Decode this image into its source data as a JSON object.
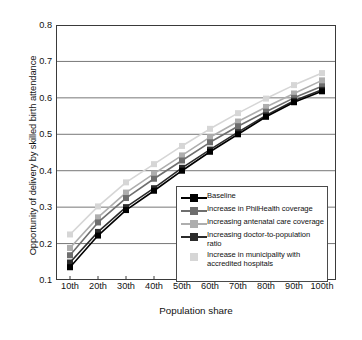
{
  "chart_data": {
    "type": "line",
    "title": "",
    "xlabel": "Population share",
    "ylabel": "Opportunity of delivery by skilled birth attendance",
    "categories": [
      "10th",
      "20th",
      "30th",
      "40th",
      "50th",
      "60th",
      "70th",
      "80th",
      "90th",
      "100th"
    ],
    "ylim": [
      0.1,
      0.8
    ],
    "yticks": [
      "0.1",
      "0.2",
      "0.3",
      "0.4",
      "0.5",
      "0.6",
      "0.7",
      "0.8"
    ],
    "grid": "horizontal",
    "legend_position": "inside-bottom-right",
    "series": [
      {
        "name": "Baseline",
        "color": "#000000",
        "marker": "square",
        "values": [
          0.135,
          0.222,
          0.292,
          0.345,
          0.4,
          0.452,
          0.5,
          0.548,
          0.588,
          0.618
        ]
      },
      {
        "name": "Increase in PhilHealth coverage",
        "color": "#6e6e6e",
        "marker": "square",
        "values": [
          0.168,
          0.258,
          0.325,
          0.378,
          0.428,
          0.478,
          0.522,
          0.562,
          0.6,
          0.632
        ]
      },
      {
        "name": "Increasing antenatal care coverage",
        "color": "#aeaeae",
        "marker": "square",
        "values": [
          0.188,
          0.272,
          0.34,
          0.392,
          0.442,
          0.492,
          0.535,
          0.575,
          0.612,
          0.648
        ]
      },
      {
        "name": "Increasing doctor-to-population ratio",
        "color": "#2b2b2b",
        "marker": "square",
        "values": [
          0.148,
          0.232,
          0.3,
          0.352,
          0.408,
          0.458,
          0.506,
          0.552,
          0.592,
          0.622
        ]
      },
      {
        "name": "Increase in municipality with accredited hospitals",
        "color": "#d6d6d6",
        "marker": "square",
        "values": [
          0.225,
          0.302,
          0.368,
          0.418,
          0.468,
          0.515,
          0.558,
          0.598,
          0.635,
          0.668
        ]
      }
    ]
  },
  "legend": {
    "items": [
      {
        "label": "Baseline",
        "color": "#000000"
      },
      {
        "label": "Increase in PhilHealth coverage",
        "color": "#6e6e6e"
      },
      {
        "label": "Increasing antenatal care coverage",
        "color": "#aeaeae"
      },
      {
        "label": "Increasing doctor-to-population ratio",
        "color": "#2b2b2b"
      },
      {
        "label": "Increase in municipality with accredited hospitals",
        "color": "#d6d6d6"
      }
    ]
  },
  "axes": {
    "y_title": "Opportunity of delivery by skilled birth attendance",
    "x_title": "Population share"
  },
  "style": {
    "grid_color": "#777777",
    "frame_color": "#3a3a3a",
    "background": "#ffffff"
  }
}
